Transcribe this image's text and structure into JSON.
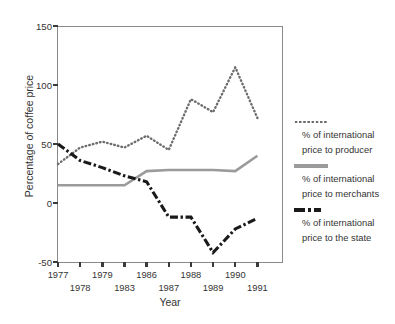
{
  "chart_data": {
    "type": "line",
    "title": "",
    "xlabel": "Year",
    "ylabel": "Percentage of coffee price",
    "xlim": [
      1977,
      1991
    ],
    "ylim": [
      -50,
      150
    ],
    "yticks": [
      -50,
      0,
      50,
      100,
      150
    ],
    "ytick_labels": [
      "-50",
      "0",
      "50",
      "100",
      "150"
    ],
    "x": [
      1977,
      1978,
      1979,
      1983,
      1986,
      1987,
      1988,
      1989,
      1990,
      1991
    ],
    "xtick_labels_row1": [
      "1977",
      "1979",
      "1986",
      "1988",
      "1990"
    ],
    "xtick_labels_row2": [
      "1978",
      "1983",
      "1987",
      "1989",
      "1991"
    ],
    "grid": false,
    "legend_position": "right",
    "series": [
      {
        "name": "% of international price to producer",
        "style": "dotted",
        "color": "#6d6d6d",
        "values": [
          33,
          47,
          52,
          47,
          57,
          45,
          88,
          77,
          115,
          72
        ]
      },
      {
        "name": "% of international price to merchants",
        "style": "solid",
        "color": "#9b9b9b",
        "values": [
          15,
          15,
          15,
          15,
          27,
          28,
          28,
          28,
          27,
          40
        ]
      },
      {
        "name": "% of international price to the state",
        "style": "dash-dot",
        "color": "#1a1a1a",
        "values": [
          50,
          36,
          30,
          23,
          18,
          -12,
          -12,
          -42,
          -22,
          -13
        ]
      }
    ]
  },
  "axes": {
    "ylabel": "Percentage of coffee price",
    "xlabel": "Year"
  },
  "legend": {
    "entries": [
      {
        "line1": "% of international",
        "line2": "price to producer",
        "marker": "dotted-line-icon"
      },
      {
        "line1": "% of international",
        "line2": "price to merchants",
        "marker": "solid-line-icon"
      },
      {
        "line1": "% of international",
        "line2": "price to the state",
        "marker": "dash-dot-line-icon"
      }
    ]
  }
}
